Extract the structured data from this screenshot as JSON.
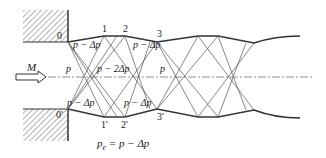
{
  "diagram": {
    "type": "underexpanded-jet-wave-pattern",
    "colors": {
      "line": "#333333",
      "wave": "#555555",
      "hatch": "#555555",
      "axis": "#666666"
    },
    "labels": {
      "top_points": [
        "0",
        "1",
        "2",
        "3"
      ],
      "bottom_points": [
        "0'",
        "1'",
        "2'",
        "3'"
      ],
      "mach": "M",
      "upper_region_1": "p − Δp",
      "upper_region_2": "p − Δp",
      "lower_region_1": "p − Δp",
      "lower_region_2": "p − Δp",
      "core_pressure": "p",
      "center_pressure": "p − 2Δp",
      "right_pressure": "p"
    },
    "caption": "p",
    "caption_sub": "e",
    "caption_rest": " = p − Δp",
    "flow_arrow": "flow-arrow-icon"
  }
}
